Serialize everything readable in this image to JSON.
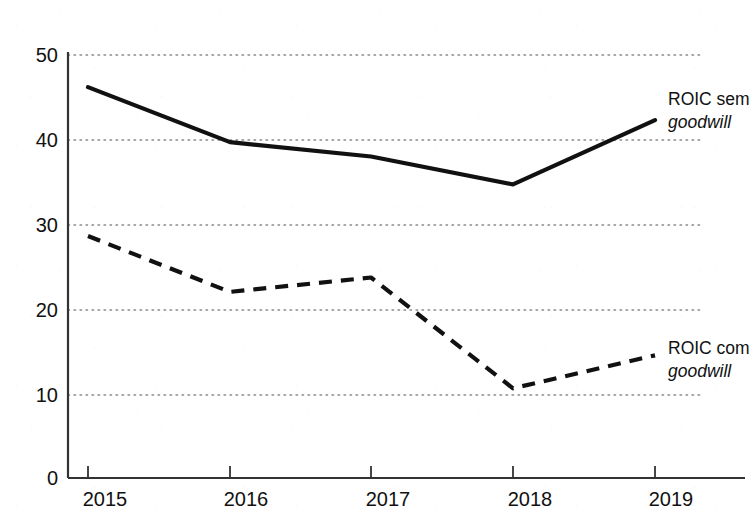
{
  "chart_data": {
    "type": "line",
    "title": "",
    "subtitle": "",
    "xlabel": "",
    "ylabel": "",
    "categories": [
      "2015",
      "2016",
      "2017",
      "2018",
      "2019"
    ],
    "x_tick_labels": [
      "2015",
      "2016",
      "2017",
      "2018",
      "2019"
    ],
    "y_tick_labels": [
      "0",
      "10",
      "20",
      "30",
      "40",
      "50"
    ],
    "y_ticks": [
      0,
      10,
      20,
      30,
      40,
      50
    ],
    "ylim": [
      0,
      50
    ],
    "grid": "horizontal-dotted",
    "legend_position": "right-inline",
    "series": [
      {
        "name": "ROIC sem goodwill",
        "label_line_1": "ROIC sem",
        "label_line_2": "goodwill",
        "style": "solid",
        "color": "#111111",
        "values": [
          46.2,
          39.7,
          38.0,
          34.7,
          42.3
        ]
      },
      {
        "name": "ROIC com goodwill",
        "label_line_1": "ROIC com",
        "label_line_2": "goodwill",
        "style": "dashed",
        "color": "#111111",
        "values": [
          28.6,
          22.0,
          23.7,
          10.6,
          14.5
        ]
      }
    ]
  },
  "axis": {
    "y_labels": [
      "50",
      "40",
      "30",
      "20",
      "10",
      "0"
    ],
    "x_labels": [
      "2015",
      "2016",
      "2017",
      "2018",
      "2019"
    ]
  },
  "legend": {
    "sem": {
      "line1": "ROIC sem",
      "line2": "goodwill"
    },
    "com": {
      "line1": "ROIC com",
      "line2": "goodwill"
    }
  },
  "colors": {
    "line": "#111111",
    "axis": "#333333",
    "grid": "#8a8a8a",
    "background": "#ffffff"
  }
}
